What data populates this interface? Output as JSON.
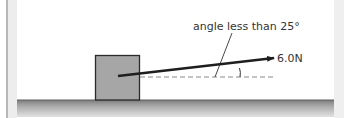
{
  "diagram": {
    "angle_label": "angle less than 25°",
    "force_label": "6.0N",
    "colors": {
      "block_fill": "#a6a6a6",
      "block_stroke": "#2b2b2b",
      "arrow": "#1e1e1e",
      "dashed_line": "#8a8a8a",
      "ground_top": "#7d7d7d",
      "ground_bottom": "#e2e2e2",
      "text": "#333333"
    },
    "elements": {
      "block": {
        "x": 95,
        "y": 55,
        "width": 45,
        "height": 45
      },
      "force_arrow": {
        "x1": 118,
        "y1": 76,
        "x2": 274,
        "y2": 58,
        "magnitude": "6.0N"
      },
      "reference_line": {
        "x1": 118,
        "y1": 77,
        "x2": 274,
        "y2": 77,
        "style": "dashed"
      },
      "angle_marker": {
        "x": 240,
        "y1": 68,
        "y2": 77
      },
      "leader_line": {
        "x1": 232,
        "y1": 33,
        "x2": 215,
        "y2": 77
      },
      "ground": {
        "y": 100
      }
    }
  }
}
